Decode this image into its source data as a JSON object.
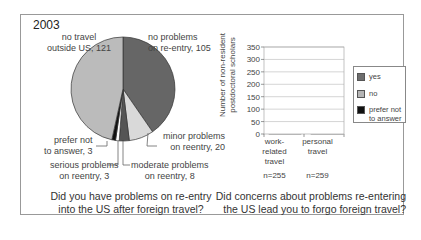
{
  "chart_data": [
    {
      "type": "pie",
      "title": "2003",
      "question": "Did you have problems on re-entry into the US after foreign travel?",
      "slices": [
        {
          "label": "no problems on re-entry",
          "value": 105,
          "color": "#666666"
        },
        {
          "label": "minor problems on reentry",
          "value": 20,
          "color": "#d9d9d9"
        },
        {
          "label": "moderate problems on reentry",
          "value": 8,
          "color": "#555555"
        },
        {
          "label": "serious problems on reentry",
          "value": 3,
          "color": "#ffffff"
        },
        {
          "label": "prefer not to answer",
          "value": 3,
          "color": "#111111"
        },
        {
          "label": "no travel outside US",
          "value": 121,
          "color": "#bbbbbb"
        }
      ]
    },
    {
      "type": "bar",
      "stacked": true,
      "question": "Did concerns about problems re-entering the US lead you to forgo foreign travel?",
      "categories": [
        "work-related travel",
        "personal travel"
      ],
      "category_notes": [
        "n=255",
        "n=259"
      ],
      "ylabel": "Number of non-resident postdoctoral scholars",
      "ylim": [
        0,
        350
      ],
      "yticks": [
        0,
        50,
        100,
        150,
        200,
        250,
        300,
        350
      ],
      "grid": true,
      "legend_position": "right",
      "series": [
        {
          "name": "prefer not to answer",
          "color": "#111111",
          "values": [
            24,
            14
          ]
        },
        {
          "name": "no",
          "color": "#b5b5b5",
          "values": [
            185,
            170
          ]
        },
        {
          "name": "yes",
          "color": "#6e6e6e",
          "values": [
            56,
            76
          ]
        }
      ]
    }
  ],
  "pie": {
    "year": "2003",
    "labels": {
      "no_travel": "no travel\noutside US, 121",
      "no_problems": "no problems\non re-entry, 105",
      "minor": "minor problems\non reentry, 20",
      "moderate": "moderate problems\non reentry, 8",
      "serious": "serious problems\non reentry, 3",
      "prefer_not": "prefer not\nto answer, 3"
    },
    "question_line1": "Did you have problems on re-entry",
    "question_line2": "into the US after foreign travel?"
  },
  "bar": {
    "ylabel_line1": "Number of non-resident",
    "ylabel_line2": "postdoctoral scholars",
    "ticks": [
      "350",
      "300",
      "250",
      "200",
      "150",
      "100",
      "50",
      "0"
    ],
    "x1_line1": "work-",
    "x1_line2": "related",
    "x1_line3": "travel",
    "x2_line1": "personal",
    "x2_line2": "travel",
    "n1": "n=255",
    "n2": "n=259",
    "legend": {
      "yes": "yes",
      "no": "no",
      "prefer1": "prefer not",
      "prefer2": "to answer"
    },
    "question_line1": "Did concerns about problems re-entering",
    "question_line2": "the US lead you to forgo foreign travel?"
  }
}
